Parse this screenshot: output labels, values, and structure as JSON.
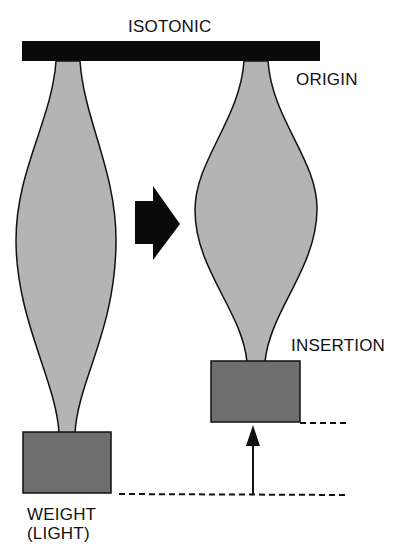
{
  "diagram": {
    "title": "ISOTONIC",
    "labels": {
      "origin": "ORIGIN",
      "insertion": "INSERTION",
      "weight_line1": "WEIGHT",
      "weight_line2": "(LIGHT)"
    },
    "colors": {
      "bar": "#0a0a0a",
      "muscle_fill": "#b4b4b4",
      "weight_fill": "#6e6e6e",
      "outline": "#111111"
    },
    "elements": [
      "isotonic-bar",
      "relaxed-muscle",
      "contracted-muscle",
      "transition-arrow",
      "left-weight",
      "right-weight",
      "displacement-arrow",
      "reference-dashed-lines"
    ]
  }
}
